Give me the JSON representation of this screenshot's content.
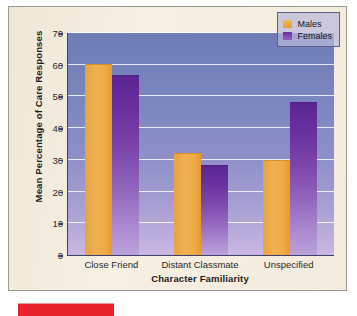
{
  "chart_data": {
    "type": "bar",
    "title": "",
    "xlabel": "Character Familiarity",
    "ylabel": "Mean Percentage of Care Responses",
    "categories": [
      "Close Friend",
      "Distant Classmate",
      "Unspecified"
    ],
    "series": [
      {
        "name": "Males",
        "color": "#e8a33d",
        "values": [
          60,
          32,
          29.5
        ]
      },
      {
        "name": "Females",
        "color": "#6a2f9f",
        "values": [
          56.5,
          28,
          48
        ]
      }
    ],
    "ylim": [
      0,
      70
    ],
    "yticks": [
      0,
      10,
      20,
      30,
      40,
      50,
      60,
      70
    ],
    "ytick_labels": [
      "0",
      "10",
      "20",
      "30",
      "40",
      "50",
      "60",
      "70"
    ],
    "grid": true,
    "legend_position": "top-right"
  },
  "legend": {
    "items": [
      {
        "label": "Males"
      },
      {
        "label": "Females"
      }
    ]
  },
  "colors": {
    "male_bar": "#e8a33d",
    "female_bar": "#6a2f9f",
    "plot_background_top": "#6f7cb5",
    "plot_background_bottom": "#c8b8e2",
    "figure_background": "#f3ecdd",
    "accent_red": "#e8242a"
  }
}
